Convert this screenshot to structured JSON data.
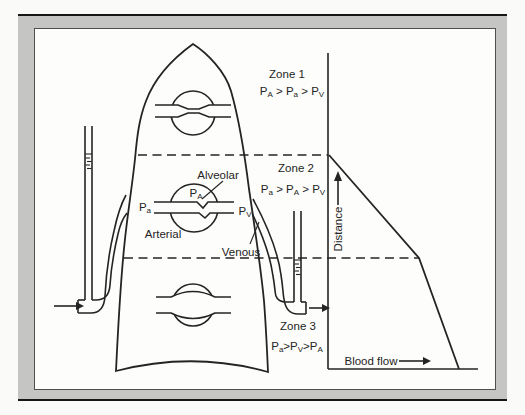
{
  "colors": {
    "ink": "#242424",
    "frame_gray": "#c5c6c4",
    "rule_black": "#161616",
    "panel_bg": "#fdfdfb",
    "page_bg": "#fafaf8"
  },
  "labels": {
    "alveolar": "Alveolar",
    "arterial": "Arterial",
    "venous": "Venous"
  },
  "pressures": {
    "pA": {
      "base": "P",
      "sub": "A"
    },
    "pa": {
      "base": "P",
      "sub": "a"
    },
    "pV": {
      "base": "P",
      "sub": "V"
    }
  },
  "zones": [
    {
      "name": "Zone 1",
      "relation": {
        "t1": {
          "base": "P",
          "sub": "A"
        },
        "op1": " > ",
        "t2": {
          "base": "P",
          "sub": "a"
        },
        "op2": " > ",
        "t3": {
          "base": "P",
          "sub": "V"
        }
      }
    },
    {
      "name": "Zone 2",
      "relation": {
        "t1": {
          "base": "P",
          "sub": "a"
        },
        "op1": " > ",
        "t2": {
          "base": "P",
          "sub": "A"
        },
        "op2": " > ",
        "t3": {
          "base": "P",
          "sub": "V"
        }
      }
    },
    {
      "name": "Zone 3",
      "relation": {
        "t1": {
          "base": "P",
          "sub": "a"
        },
        "op1": ">",
        "t2": {
          "base": "P",
          "sub": "V"
        },
        "op2": ">",
        "t3": {
          "base": "P",
          "sub": "A"
        }
      }
    }
  ],
  "graph": {
    "y_axis_label": "Distance",
    "x_axis_label": "Blood flow",
    "numeric_scale_shown": false,
    "curve_points_norm_xy": [
      [
        0,
        0.68
      ],
      [
        0.61,
        0.35
      ],
      [
        0.87,
        0
      ]
    ]
  }
}
